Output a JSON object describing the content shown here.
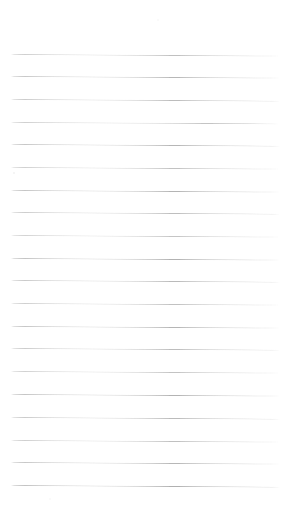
{
  "document": {
    "type": "scanned-lined-paper",
    "title": "Blank ruled notebook page",
    "content_text": "",
    "width_px": 289,
    "height_px": 513,
    "background_color": "#ffffff",
    "rule_color": "#9a9a9a",
    "rule_count": 20,
    "rule_left_px": 11,
    "rule_right_px": 280,
    "rule_first_y_px": 54,
    "rule_spacing_px": 22.7,
    "rule_thickness_px": 1,
    "scan_skew_deg": 0.35,
    "top_margin_px": 54,
    "bottom_margin_px": 28
  },
  "rules": [
    {
      "index": 1,
      "y": 54,
      "opacity": 0.62,
      "skew": 0.34
    },
    {
      "index": 2,
      "y": 76,
      "opacity": 0.7,
      "skew": 0.33
    },
    {
      "index": 3,
      "y": 99,
      "opacity": 0.66,
      "skew": 0.36
    },
    {
      "index": 4,
      "y": 122,
      "opacity": 0.58,
      "skew": 0.32
    },
    {
      "index": 5,
      "y": 144,
      "opacity": 0.72,
      "skew": 0.35
    },
    {
      "index": 6,
      "y": 167,
      "opacity": 0.6,
      "skew": 0.34
    },
    {
      "index": 7,
      "y": 190,
      "opacity": 0.74,
      "skew": 0.33
    },
    {
      "index": 8,
      "y": 212,
      "opacity": 0.64,
      "skew": 0.36
    },
    {
      "index": 9,
      "y": 235,
      "opacity": 0.57,
      "skew": 0.34
    },
    {
      "index": 10,
      "y": 258,
      "opacity": 0.76,
      "skew": 0.33
    },
    {
      "index": 11,
      "y": 280,
      "opacity": 0.68,
      "skew": 0.35
    },
    {
      "index": 12,
      "y": 303,
      "opacity": 0.61,
      "skew": 0.34
    },
    {
      "index": 13,
      "y": 326,
      "opacity": 0.73,
      "skew": 0.33
    },
    {
      "index": 14,
      "y": 348,
      "opacity": 0.65,
      "skew": 0.36
    },
    {
      "index": 15,
      "y": 371,
      "opacity": 0.59,
      "skew": 0.34
    },
    {
      "index": 16,
      "y": 394,
      "opacity": 0.75,
      "skew": 0.33
    },
    {
      "index": 17,
      "y": 417,
      "opacity": 0.67,
      "skew": 0.35
    },
    {
      "index": 18,
      "y": 440,
      "opacity": 0.62,
      "skew": 0.34
    },
    {
      "index": 19,
      "y": 462,
      "opacity": 0.71,
      "skew": 0.33
    },
    {
      "index": 20,
      "y": 485,
      "opacity": 0.78,
      "skew": 0.35
    }
  ],
  "artifacts": [
    {
      "name": "speck-top",
      "x": 157,
      "y": 19,
      "size": 2.0,
      "opacity": 0.18
    },
    {
      "name": "speck-left-rule",
      "x": 13,
      "y": 172,
      "size": 2.4,
      "opacity": 0.32
    },
    {
      "name": "speck-lower",
      "x": 49,
      "y": 498,
      "size": 1.6,
      "opacity": 0.14
    }
  ]
}
